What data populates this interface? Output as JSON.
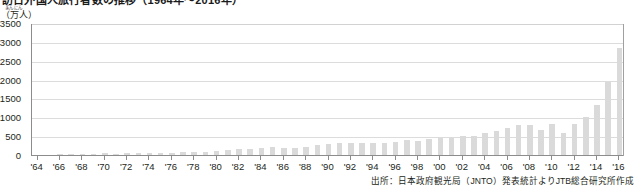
{
  "title": {
    "text": "訪日外国人旅行者数の推移（1964年～2016年）"
  },
  "yaxis": {
    "unit_ruby": "まんにん",
    "unit_base": "（万人）",
    "ticks": [
      "0",
      "500",
      "1000",
      "1500",
      "2000",
      "2500",
      "3000",
      "3500"
    ]
  },
  "source": {
    "text": "出所：日本政府観光局（JNTO）発表統計よりJTB総合研究所作成"
  },
  "chart_data": {
    "type": "bar",
    "title": "訪日外国人旅行者数の推移（1964年～2016年）",
    "xlabel": "",
    "ylabel": "（万人）",
    "ylim": [
      0,
      3500
    ],
    "ytick_values": [
      0,
      500,
      1000,
      1500,
      2000,
      2500,
      3000,
      3500
    ],
    "grid": true,
    "legend": "none",
    "bar_color": "#dadada",
    "axis_color": "#8c8c8c",
    "tick_label_years": [
      "'64",
      "'66",
      "'68",
      "'70",
      "'72",
      "'74",
      "'76",
      "'78",
      "'80",
      "'82",
      "'84",
      "'86",
      "'88",
      "'90",
      "'92",
      "'94",
      "'96",
      "'98",
      "'00",
      "'02",
      "'04",
      "'06",
      "'08",
      "'10",
      "'12",
      "'14",
      "'16"
    ],
    "categories": [
      "1964",
      "1965",
      "1966",
      "1967",
      "1968",
      "1969",
      "1970",
      "1971",
      "1972",
      "1973",
      "1974",
      "1975",
      "1976",
      "1977",
      "1978",
      "1979",
      "1980",
      "1981",
      "1982",
      "1983",
      "1984",
      "1985",
      "1986",
      "1987",
      "1988",
      "1989",
      "1990",
      "1991",
      "1992",
      "1993",
      "1994",
      "1995",
      "1996",
      "1997",
      "1998",
      "1999",
      "2000",
      "2001",
      "2002",
      "2003",
      "2004",
      "2005",
      "2006",
      "2007",
      "2008",
      "2009",
      "2010",
      "2011",
      "2012",
      "2013",
      "2014",
      "2015",
      "2016"
    ],
    "values": [
      35,
      37,
      43,
      48,
      52,
      61,
      85,
      66,
      72,
      78,
      76,
      82,
      91,
      103,
      103,
      113,
      132,
      158,
      179,
      197,
      221,
      233,
      206,
      216,
      236,
      284,
      324,
      353,
      358,
      341,
      346,
      335,
      384,
      422,
      411,
      444,
      476,
      477,
      524,
      521,
      614,
      673,
      733,
      835,
      835,
      679,
      861,
      622,
      836,
      1036,
      1341,
      1974,
      2869
    ]
  }
}
